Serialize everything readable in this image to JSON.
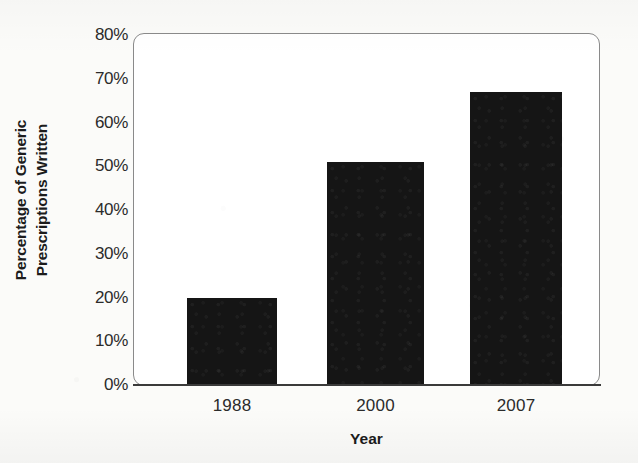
{
  "chart_data": {
    "type": "bar",
    "title": "",
    "subtitle": "",
    "categories": [
      "1988",
      "2000",
      "2007"
    ],
    "values": [
      20,
      51,
      67
    ],
    "value_labels": [
      "",
      "",
      ""
    ],
    "xlabel": "Year",
    "ylabel": "Percentage of Generic Prescriptions Written",
    "ylabel_lines": [
      "Percentage of Generic",
      "Prescriptions Written"
    ],
    "ylim": [
      0,
      80
    ],
    "ytick_values": [
      0,
      10,
      20,
      30,
      40,
      50,
      60,
      70,
      80
    ],
    "ytick_labels": [
      "0%",
      "10%",
      "20%",
      "30%",
      "40%",
      "50%",
      "60%",
      "70%",
      "80%"
    ],
    "grid": false,
    "legend": null,
    "legend_position": "none",
    "series": [
      {
        "name": "Percentage of Generic Prescriptions Written",
        "values": [
          20,
          51,
          67
        ]
      }
    ],
    "annotations": [],
    "colors": {
      "bar_fill": "#151515",
      "plot_background": "#ffffff",
      "figure_background": "#fbfbf9",
      "frame_stroke": "#8a8a8a",
      "baseline_stroke": "#3a3a3a",
      "tick_text": "#2b2b2b",
      "axis_title_text": "#1c1c1c"
    }
  }
}
